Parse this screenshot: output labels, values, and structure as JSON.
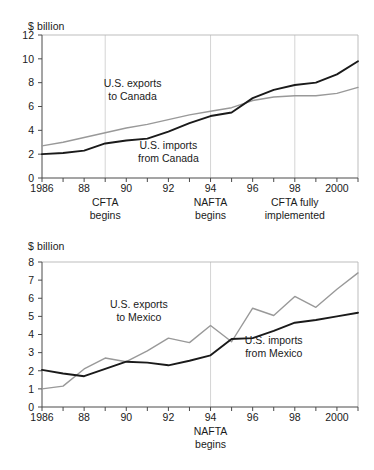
{
  "figure": {
    "unit_label_top": "$ billion",
    "unit_label_bottom": "$ billion"
  },
  "chart_data": [
    {
      "type": "line",
      "id": "canada",
      "title": "",
      "xlabel": "",
      "ylabel": "$ billion",
      "unit_label": "$ billion",
      "xlim": [
        1986,
        2001
      ],
      "ylim": [
        0,
        12
      ],
      "ytick_labels": [
        "0",
        "2",
        "4",
        "6",
        "8",
        "10",
        "12"
      ],
      "ytick_values": [
        0,
        2,
        4,
        6,
        8,
        10,
        12
      ],
      "xtick_values": [
        1986,
        1987,
        1988,
        1989,
        1990,
        1991,
        1992,
        1993,
        1994,
        1995,
        1996,
        1997,
        1998,
        1999,
        2000,
        2001
      ],
      "xtick_labels": [
        "1986",
        "",
        "88",
        "",
        "90",
        "",
        "92",
        "",
        "94",
        "",
        "96",
        "",
        "98",
        "",
        "2000",
        ""
      ],
      "grid": "vertical-event-lines-only",
      "legend": "inline-annotations",
      "x": [
        1986,
        1987,
        1988,
        1989,
        1990,
        1991,
        1992,
        1993,
        1994,
        1995,
        1996,
        1997,
        1998,
        1999,
        2000,
        2001
      ],
      "series": [
        {
          "name": "U.S. exports to Canada",
          "color": "#999999",
          "values": [
            2.7,
            3.0,
            3.4,
            3.8,
            4.2,
            4.5,
            4.9,
            5.3,
            5.6,
            5.9,
            6.5,
            6.8,
            6.9,
            6.9,
            7.1,
            7.6,
            8.05
          ]
        },
        {
          "name": "U.S. imports from Canada",
          "color": "#1a1a1a",
          "values": [
            2.0,
            2.1,
            2.3,
            2.9,
            3.15,
            3.3,
            3.9,
            4.6,
            5.2,
            5.5,
            6.7,
            7.4,
            7.8,
            8.0,
            8.7,
            9.8
          ]
        }
      ],
      "annotations": [
        {
          "text_line1": "U.S. exports",
          "text_line2": "to Canada",
          "x": 1990.3,
          "y": 7.6
        },
        {
          "text_line1": "U.S. imports",
          "text_line2": "from Canada",
          "x": 1992.0,
          "y": 2.45
        }
      ],
      "event_lines": [
        {
          "year": 1989,
          "line1": "CFTA",
          "line2": "begins"
        },
        {
          "year": 1994,
          "line1": "NAFTA",
          "line2": "begins"
        },
        {
          "year": 1998,
          "line1": "CFTA fully",
          "line2": "implemented"
        }
      ]
    },
    {
      "type": "line",
      "id": "mexico",
      "title": "",
      "xlabel": "",
      "ylabel": "$ billion",
      "unit_label": "$ billion",
      "xlim": [
        1986,
        2001
      ],
      "ylim": [
        0,
        8
      ],
      "ytick_labels": [
        "0",
        "1",
        "2",
        "3",
        "4",
        "5",
        "6",
        "7",
        "8"
      ],
      "ytick_values": [
        0,
        1,
        2,
        3,
        4,
        5,
        6,
        7,
        8
      ],
      "xtick_values": [
        1986,
        1987,
        1988,
        1989,
        1990,
        1991,
        1992,
        1993,
        1994,
        1995,
        1996,
        1997,
        1998,
        1999,
        2000,
        2001
      ],
      "xtick_labels": [
        "1986",
        "",
        "88",
        "",
        "90",
        "",
        "92",
        "",
        "94",
        "",
        "96",
        "",
        "98",
        "",
        "2000",
        ""
      ],
      "grid": "vertical-event-lines-only",
      "legend": "inline-annotations",
      "x": [
        1986,
        1987,
        1988,
        1989,
        1990,
        1991,
        1992,
        1993,
        1994,
        1995,
        1996,
        1997,
        1998,
        1999,
        2000,
        2001
      ],
      "series": [
        {
          "name": "U.S. exports to Mexico",
          "color": "#999999",
          "values": [
            1.0,
            1.15,
            2.1,
            2.7,
            2.5,
            3.1,
            3.8,
            3.55,
            4.5,
            3.6,
            5.45,
            5.05,
            6.1,
            5.5,
            6.5,
            7.4
          ]
        },
        {
          "name": "U.S. imports from Mexico",
          "color": "#1a1a1a",
          "values": [
            2.05,
            1.85,
            1.7,
            2.1,
            2.5,
            2.45,
            2.3,
            2.55,
            2.85,
            3.75,
            3.8,
            4.2,
            4.65,
            4.8,
            5.0,
            5.2
          ]
        }
      ],
      "annotations": [
        {
          "text_line1": "U.S. exports",
          "text_line2": "to Mexico",
          "x": 1990.6,
          "y": 5.45
        },
        {
          "text_line1": "U.S. imports",
          "text_line2": "from Mexico",
          "x": 1997.0,
          "y": 3.45
        }
      ],
      "event_lines": [
        {
          "year": 1994,
          "line1": "NAFTA",
          "line2": "begins"
        }
      ]
    }
  ]
}
